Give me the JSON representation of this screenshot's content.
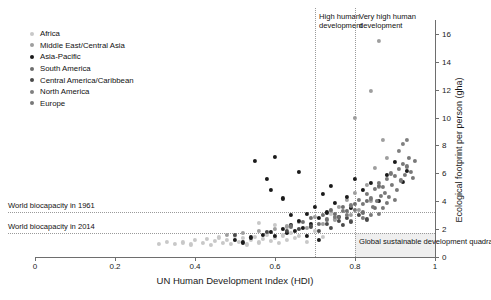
{
  "chart_data": {
    "type": "scatter",
    "title": "",
    "xlabel": "UN Human Development Index (HDI)",
    "ylabel": "Ecological footprint per person (gha)",
    "xlim": [
      0,
      1
    ],
    "ylim": [
      0,
      17
    ],
    "xticks": [
      0,
      0.2,
      0.4,
      0.6,
      0.8,
      1
    ],
    "xticklabels": [
      "0",
      "0.2",
      "0.4",
      "0.6",
      "0.8",
      "1"
    ],
    "yticks": [
      0,
      2,
      4,
      6,
      8,
      10,
      12,
      14,
      16
    ],
    "yticklabels": [
      "0",
      "2",
      "4",
      "6",
      "8",
      "10",
      "12",
      "14",
      "16"
    ],
    "grid": false,
    "legend_position": "upper-left",
    "hlines": [
      {
        "name": "biocapacity-1961",
        "value": 3.2,
        "label": "World biocapacity in 1961"
      },
      {
        "name": "biocapacity-2014",
        "value": 1.7,
        "label": "World biocapacity in 2014"
      }
    ],
    "vlines": [
      {
        "name": "high-human-development",
        "value": 0.7,
        "label": "High human development"
      },
      {
        "name": "very-high-human-development",
        "value": 0.8,
        "label": "Very high human development"
      }
    ],
    "shaded_region": {
      "name": "global-sustainable-development-quadrant",
      "label": "Global sustainable development quadrant",
      "x_from": 0.8,
      "x_to": 1.0,
      "y_from": 0.0,
      "y_to": 1.7
    },
    "series": [
      {
        "name": "Africa",
        "color": "#c8c8c8",
        "points": [
          [
            0.35,
            0.95
          ],
          [
            0.37,
            1.05
          ],
          [
            0.39,
            0.9
          ],
          [
            0.4,
            1.2
          ],
          [
            0.42,
            1.0
          ],
          [
            0.43,
            1.3
          ],
          [
            0.44,
            0.85
          ],
          [
            0.45,
            1.15
          ],
          [
            0.46,
            1.4
          ],
          [
            0.47,
            1.0
          ],
          [
            0.48,
            1.25
          ],
          [
            0.49,
            0.95
          ],
          [
            0.5,
            1.5
          ],
          [
            0.51,
            1.1
          ],
          [
            0.52,
            1.35
          ],
          [
            0.53,
            0.9
          ],
          [
            0.54,
            1.2
          ],
          [
            0.55,
            1.45
          ],
          [
            0.56,
            1.05
          ],
          [
            0.57,
            1.3
          ],
          [
            0.58,
            1.6
          ],
          [
            0.59,
            1.15
          ],
          [
            0.6,
            1.4
          ],
          [
            0.61,
            1.0
          ],
          [
            0.62,
            1.55
          ],
          [
            0.63,
            1.25
          ],
          [
            0.64,
            1.7
          ],
          [
            0.65,
            1.35
          ],
          [
            0.66,
            1.5
          ],
          [
            0.68,
            1.1
          ],
          [
            0.7,
            1.85
          ],
          [
            0.72,
            1.45
          ],
          [
            0.74,
            3.1
          ],
          [
            0.56,
            2.45
          ],
          [
            0.6,
            2.3
          ],
          [
            0.33,
            1.1
          ],
          [
            0.31,
            0.95
          ]
        ]
      },
      {
        "name": "Middle East/Central Asia",
        "color": "#9e9e9e",
        "points": [
          [
            0.48,
            1.6
          ],
          [
            0.52,
            1.75
          ],
          [
            0.56,
            1.9
          ],
          [
            0.6,
            2.0
          ],
          [
            0.63,
            2.2
          ],
          [
            0.66,
            2.5
          ],
          [
            0.68,
            2.1
          ],
          [
            0.7,
            2.9
          ],
          [
            0.72,
            2.4
          ],
          [
            0.74,
            3.3
          ],
          [
            0.75,
            2.7
          ],
          [
            0.76,
            3.6
          ],
          [
            0.78,
            4.1
          ],
          [
            0.79,
            3.0
          ],
          [
            0.8,
            4.6
          ],
          [
            0.81,
            3.4
          ],
          [
            0.83,
            5.2
          ],
          [
            0.84,
            4.0
          ],
          [
            0.85,
            6.4
          ],
          [
            0.86,
            5.0
          ],
          [
            0.87,
            8.4
          ],
          [
            0.88,
            7.1
          ],
          [
            0.8,
            10.0
          ],
          [
            0.84,
            11.9
          ],
          [
            0.86,
            15.5
          ]
        ]
      },
      {
        "name": "Asia-Pacific",
        "color": "#1a1a1a",
        "points": [
          [
            0.5,
            1.2
          ],
          [
            0.54,
            1.4
          ],
          [
            0.57,
            1.6
          ],
          [
            0.59,
            1.8
          ],
          [
            0.6,
            1.5
          ],
          [
            0.62,
            2.0
          ],
          [
            0.63,
            1.7
          ],
          [
            0.64,
            2.3
          ],
          [
            0.65,
            1.9
          ],
          [
            0.66,
            2.6
          ],
          [
            0.67,
            2.1
          ],
          [
            0.68,
            3.1
          ],
          [
            0.69,
            2.4
          ],
          [
            0.7,
            3.6
          ],
          [
            0.71,
            2.8
          ],
          [
            0.72,
            4.5
          ],
          [
            0.73,
            3.2
          ],
          [
            0.74,
            5.1
          ],
          [
            0.75,
            3.9
          ],
          [
            0.76,
            2.9
          ],
          [
            0.78,
            4.3
          ],
          [
            0.79,
            3.5
          ],
          [
            0.8,
            5.6
          ],
          [
            0.82,
            4.8
          ],
          [
            0.84,
            5.3
          ],
          [
            0.86,
            4.0
          ],
          [
            0.88,
            5.9
          ],
          [
            0.9,
            6.8
          ],
          [
            0.92,
            5.4
          ],
          [
            0.93,
            6.2
          ],
          [
            0.55,
            6.9
          ],
          [
            0.6,
            7.2
          ],
          [
            0.58,
            5.6
          ],
          [
            0.59,
            4.8
          ],
          [
            0.62,
            4.2
          ],
          [
            0.66,
            6.1
          ],
          [
            0.64,
            3.0
          ],
          [
            0.68,
            1.5
          ],
          [
            0.71,
            1.2
          ],
          [
            0.52,
            1.05
          ]
        ]
      },
      {
        "name": "South America",
        "color": "#6e6e6e",
        "points": [
          [
            0.64,
            2.2
          ],
          [
            0.67,
            2.5
          ],
          [
            0.69,
            2.8
          ],
          [
            0.71,
            2.4
          ],
          [
            0.72,
            3.0
          ],
          [
            0.73,
            2.7
          ],
          [
            0.74,
            3.4
          ],
          [
            0.75,
            3.1
          ],
          [
            0.76,
            2.9
          ],
          [
            0.77,
            3.6
          ],
          [
            0.78,
            3.3
          ],
          [
            0.79,
            2.6
          ],
          [
            0.8,
            3.8
          ],
          [
            0.82,
            3.2
          ],
          [
            0.83,
            4.0
          ],
          [
            0.85,
            3.5
          ],
          [
            0.86,
            5.1
          ]
        ]
      },
      {
        "name": "Central America/Caribbean",
        "color": "#4a4a4a",
        "points": [
          [
            0.5,
            1.6
          ],
          [
            0.58,
            1.8
          ],
          [
            0.63,
            1.9
          ],
          [
            0.66,
            2.0
          ],
          [
            0.69,
            2.2
          ],
          [
            0.71,
            1.9
          ],
          [
            0.73,
            2.4
          ],
          [
            0.74,
            2.1
          ],
          [
            0.76,
            2.6
          ],
          [
            0.77,
            2.3
          ],
          [
            0.78,
            2.8
          ],
          [
            0.79,
            2.5
          ],
          [
            0.81,
            3.0
          ],
          [
            0.83,
            2.7
          ]
        ]
      },
      {
        "name": "North America",
        "color": "#808080",
        "points": [
          [
            0.92,
            8.1
          ],
          [
            0.93,
            8.4
          ],
          [
            0.91,
            7.6
          ]
        ]
      },
      {
        "name": "Europe",
        "color": "#787878",
        "points": [
          [
            0.75,
            2.9
          ],
          [
            0.77,
            3.3
          ],
          [
            0.78,
            3.0
          ],
          [
            0.79,
            3.7
          ],
          [
            0.8,
            3.4
          ],
          [
            0.81,
            4.1
          ],
          [
            0.82,
            3.8
          ],
          [
            0.83,
            4.5
          ],
          [
            0.84,
            4.2
          ],
          [
            0.845,
            3.6
          ],
          [
            0.85,
            4.9
          ],
          [
            0.855,
            4.0
          ],
          [
            0.86,
            5.3
          ],
          [
            0.865,
            4.4
          ],
          [
            0.87,
            5.0
          ],
          [
            0.875,
            4.6
          ],
          [
            0.88,
            5.6
          ],
          [
            0.885,
            4.3
          ],
          [
            0.89,
            6.0
          ],
          [
            0.893,
            5.2
          ],
          [
            0.9,
            5.8
          ],
          [
            0.905,
            4.8
          ],
          [
            0.91,
            6.3
          ],
          [
            0.915,
            5.5
          ],
          [
            0.92,
            6.7
          ],
          [
            0.925,
            5.9
          ],
          [
            0.93,
            6.5
          ],
          [
            0.935,
            7.1
          ],
          [
            0.94,
            6.1
          ],
          [
            0.945,
            5.7
          ],
          [
            0.95,
            6.9
          ],
          [
            0.88,
            3.9
          ],
          [
            0.9,
            4.1
          ],
          [
            0.87,
            3.5
          ],
          [
            0.86,
            3.1
          ],
          [
            0.84,
            3.0
          ],
          [
            0.82,
            2.8
          ]
        ]
      }
    ]
  }
}
